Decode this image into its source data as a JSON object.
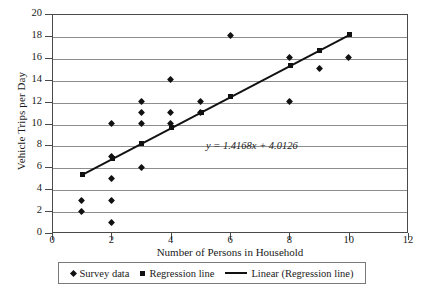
{
  "chart_data": {
    "type": "scatter",
    "title": "",
    "xlabel": "Number of Persons in Household",
    "ylabel": "Vehicle Trips per Day",
    "xlim": [
      0,
      12
    ],
    "ylim": [
      0,
      20
    ],
    "xticks": [
      0,
      2,
      4,
      6,
      8,
      10,
      12
    ],
    "yticks": [
      0,
      2,
      4,
      6,
      8,
      10,
      12,
      14,
      16,
      18,
      20
    ],
    "grid": "horizontal",
    "legend_position": "below-axis",
    "annotation": "y = 1.4168x + 4.0126",
    "regression_slope": 1.4168,
    "regression_intercept": 4.0126,
    "series": [
      {
        "name": "Survey data",
        "marker": "diamond",
        "color": "#111111",
        "points": [
          {
            "x": 1,
            "y": 2
          },
          {
            "x": 1,
            "y": 3
          },
          {
            "x": 2,
            "y": 1
          },
          {
            "x": 2,
            "y": 3
          },
          {
            "x": 2,
            "y": 5
          },
          {
            "x": 2,
            "y": 7
          },
          {
            "x": 2,
            "y": 10
          },
          {
            "x": 3,
            "y": 6
          },
          {
            "x": 3,
            "y": 10
          },
          {
            "x": 3,
            "y": 11
          },
          {
            "x": 3,
            "y": 12
          },
          {
            "x": 4,
            "y": 10
          },
          {
            "x": 4,
            "y": 11
          },
          {
            "x": 4,
            "y": 14
          },
          {
            "x": 5,
            "y": 11
          },
          {
            "x": 5,
            "y": 12
          },
          {
            "x": 6,
            "y": 18
          },
          {
            "x": 8,
            "y": 12
          },
          {
            "x": 8,
            "y": 16
          },
          {
            "x": 9,
            "y": 15
          },
          {
            "x": 10,
            "y": 16
          }
        ]
      },
      {
        "name": "Regression line",
        "marker": "square",
        "color": "#111111",
        "points": [
          {
            "x": 1,
            "y": 5.43
          },
          {
            "x": 2,
            "y": 6.85
          },
          {
            "x": 3,
            "y": 8.27
          },
          {
            "x": 4,
            "y": 9.68
          },
          {
            "x": 5,
            "y": 11.1
          },
          {
            "x": 6,
            "y": 12.52
          },
          {
            "x": 8,
            "y": 15.35
          },
          {
            "x": 9,
            "y": 16.77
          },
          {
            "x": 10,
            "y": 18.18
          }
        ]
      },
      {
        "name": "Linear (Regression line)",
        "marker": "line",
        "color": "#111111",
        "x_start": 1,
        "y_start": 5.43,
        "x_end": 10,
        "y_end": 18.18
      }
    ]
  },
  "legend": {
    "items": [
      {
        "label": "Survey data",
        "marker": "diamond"
      },
      {
        "label": "Regression line",
        "marker": "square"
      },
      {
        "label": "Linear (Regression line)",
        "marker": "line"
      }
    ]
  }
}
